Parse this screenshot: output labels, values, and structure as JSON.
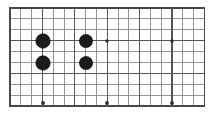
{
  "figure": {
    "title": "Go board diagram",
    "caption": "",
    "background_color": "#ffffff"
  },
  "chart_data": {
    "type": "table",
    "title": "Go board diagram",
    "subtitle": "",
    "xlabel": "",
    "ylabel": "",
    "grid": true,
    "legend_position": "none",
    "board": {
      "name": "goban-grid",
      "columns": 18,
      "rows": 9,
      "cell_width": 10.8,
      "cell_height": 10.9,
      "origin_x": 10,
      "origin_y": 8,
      "line_color": "#8a8a8a",
      "major_line_color": "#555555",
      "border_color": "#4a4a4a",
      "major_columns": [
        0,
        3,
        6,
        9,
        12,
        15,
        18
      ],
      "major_rows": [
        0,
        3,
        6,
        9
      ]
    },
    "stones": [
      {
        "id": "stone-1",
        "color": "black",
        "col": 3,
        "row": 3,
        "cx": 43,
        "cy": 41,
        "r": 7.2
      },
      {
        "id": "stone-2",
        "color": "black",
        "col": 3,
        "row": 6,
        "cx": 43,
        "cy": 63,
        "r": 7.2
      },
      {
        "id": "stone-3",
        "color": "black",
        "col": 7,
        "row": 3,
        "cx": 86,
        "cy": 41,
        "r": 6.6
      },
      {
        "id": "stone-4",
        "color": "black",
        "col": 7,
        "row": 6,
        "cx": 86,
        "cy": 63,
        "r": 6.6
      }
    ],
    "star_points": [
      {
        "id": "star-1",
        "col": 9,
        "row": 3,
        "cx": 107,
        "cy": 41,
        "r": 1.7
      },
      {
        "id": "star-2",
        "col": 15,
        "row": 3,
        "cx": 172,
        "cy": 41,
        "r": 1.7
      },
      {
        "id": "star-3",
        "col": 3,
        "row": 9,
        "cx": 43,
        "cy": 103,
        "r": 1.9
      },
      {
        "id": "star-4",
        "col": 9,
        "row": 9,
        "cx": 107,
        "cy": 103,
        "r": 1.9
      },
      {
        "id": "star-5",
        "col": 15,
        "row": 9,
        "cx": 172,
        "cy": 103,
        "r": 1.9
      }
    ],
    "colors": {
      "stone_black": "#1b1b1b",
      "grid_minor": "#8a8a8a",
      "grid_major": "#555555",
      "border": "#4a4a4a",
      "star": "#2b2b2b",
      "background": "#ffffff"
    }
  }
}
